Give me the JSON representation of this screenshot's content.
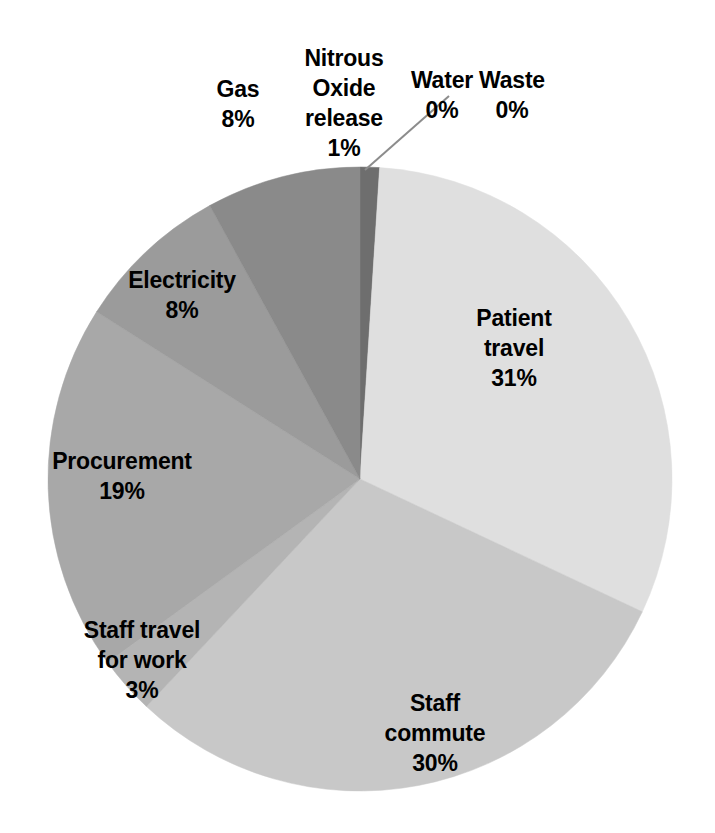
{
  "chart_data": {
    "type": "pie",
    "title": "",
    "subtitle": "",
    "xlabel": "",
    "ylabel": "",
    "legend": "none",
    "grid": false,
    "units": "percent",
    "start_angle_deg": 0,
    "direction": "clockwise",
    "categories": [
      "Nitrous Oxide release",
      "Water",
      "Waste",
      "Patient travel",
      "Staff commute",
      "Staff travel for work",
      "Procurement",
      "Electricity",
      "Gas"
    ],
    "values": [
      1,
      0,
      0,
      31,
      30,
      3,
      19,
      8,
      8
    ],
    "value_labels": [
      "1%",
      "0%",
      "0%",
      "31%",
      "30%",
      "3%",
      "19%",
      "8%",
      "8%"
    ],
    "colors": [
      "#6e6e6e",
      "#6e6e6e",
      "#6e6e6e",
      "#dfdfdf",
      "#c8c8c8",
      "#b4b4b4",
      "#a8a8a8",
      "#9b9b9b",
      "#8a8a8a"
    ],
    "slices": [
      {
        "name": "Nitrous Oxide release",
        "value": 1,
        "value_label": "1%",
        "color": "#6e6e6e",
        "label_text": "Nitrous\nOxide\nrelease",
        "label_x": 344,
        "label_y": 103,
        "has_leader_line": false
      },
      {
        "name": "Water",
        "value": 0,
        "value_label": "0%",
        "color": "#6e6e6e",
        "label_text": "Water",
        "label_x": 442,
        "label_y": 95,
        "has_leader_line": true,
        "leader_from_x": 365,
        "leader_from_y": 170,
        "leader_to_x": 449,
        "leader_to_y": 96
      },
      {
        "name": "Waste",
        "value": 0,
        "value_label": "0%",
        "color": "#6e6e6e",
        "label_text": "Waste",
        "label_x": 512,
        "label_y": 95,
        "has_leader_line": false
      },
      {
        "name": "Patient travel",
        "value": 31,
        "value_label": "31%",
        "color": "#dfdfdf",
        "label_text": "Patient\ntravel",
        "label_x": 514,
        "label_y": 348,
        "has_leader_line": false
      },
      {
        "name": "Staff commute",
        "value": 30,
        "value_label": "30%",
        "color": "#c8c8c8",
        "label_text": "Staff\ncommute",
        "label_x": 435,
        "label_y": 733,
        "has_leader_line": false
      },
      {
        "name": "Staff travel for work",
        "value": 3,
        "value_label": "3%",
        "color": "#b4b4b4",
        "label_text": "Staff travel\nfor work",
        "label_x": 142,
        "label_y": 660,
        "has_leader_line": false
      },
      {
        "name": "Procurement",
        "value": 19,
        "value_label": "19%",
        "color": "#a8a8a8",
        "label_text": "Procurement",
        "label_x": 122,
        "label_y": 476,
        "has_leader_line": false
      },
      {
        "name": "Electricity",
        "value": 8,
        "value_label": "8%",
        "color": "#9b9b9b",
        "label_text": "Electricity",
        "label_x": 182,
        "label_y": 295,
        "has_leader_line": false
      },
      {
        "name": "Gas",
        "value": 8,
        "value_label": "8%",
        "color": "#8a8a8a",
        "label_text": "Gas",
        "label_x": 238,
        "label_y": 104,
        "has_leader_line": false
      }
    ],
    "geometry": {
      "center_x": 360,
      "center_y": 479,
      "radius": 312
    },
    "background_color": "#ffffff",
    "label_color": "#000000"
  }
}
